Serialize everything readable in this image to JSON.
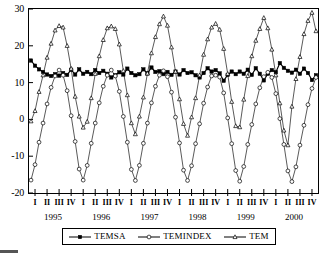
{
  "chart_data": {
    "type": "line",
    "title": "",
    "subtitle": "",
    "xlabel": "",
    "ylabel": "",
    "ylim": [
      -20,
      30
    ],
    "yticks": [
      30,
      20,
      10,
      0,
      -10,
      -20
    ],
    "grid": false,
    "legend_position": "bottom",
    "x_quarter_labels": [
      "I",
      "II",
      "III",
      "IV",
      "I",
      "II",
      "III",
      "IV",
      "I",
      "II",
      "III",
      "IV",
      "I",
      "II",
      "III",
      "IV",
      "I",
      "II",
      "III",
      "IV",
      "I",
      "II",
      "III",
      "IV"
    ],
    "x_year_labels": [
      "1995",
      "1996",
      "1997",
      "1998",
      "1999",
      "2000"
    ],
    "x_points_per_year": 12,
    "x_note": "monthly observations, Jan 1995 - Dec 2000",
    "series": [
      {
        "name": "TEMSA",
        "marker": "filled-square",
        "values": [
          16.0,
          14.6,
          13.6,
          12.9,
          12.2,
          11.8,
          12.3,
          11.9,
          12.6,
          12.1,
          13.5,
          12.2,
          13.6,
          12.4,
          12.9,
          12.3,
          13.4,
          12.6,
          13.2,
          12.4,
          11.4,
          12.0,
          12.8,
          12.2,
          13.8,
          12.6,
          12.0,
          12.3,
          13.6,
          12.5,
          14.1,
          12.9,
          13.1,
          12.3,
          12.9,
          12.1,
          13.0,
          12.2,
          13.4,
          12.6,
          12.8,
          12.0,
          11.4,
          12.6,
          13.9,
          13.0,
          13.4,
          12.5,
          10.5,
          12.1,
          13.0,
          12.3,
          13.0,
          12.4,
          13.5,
          12.1,
          13.9,
          12.4,
          10.6,
          12.4,
          13.4,
          12.8,
          15.3,
          14.0,
          13.2,
          12.7,
          13.5,
          12.4,
          13.8,
          12.6,
          10.7,
          12.0
        ]
      },
      {
        "name": "TEMINDEX",
        "marker": "open-circle",
        "values": [
          -16.5,
          -12.3,
          -6.2,
          -1.0,
          4.2,
          8.7,
          11.8,
          13.4,
          12.0,
          7.8,
          1.0,
          -6.0,
          -13.5,
          -16.5,
          -12.5,
          -6.5,
          -1.0,
          4.5,
          9.0,
          12.0,
          13.4,
          11.8,
          7.6,
          0.8,
          -6.2,
          -13.6,
          -16.6,
          -12.5,
          -6.5,
          -1.0,
          4.5,
          9.0,
          12.0,
          13.2,
          11.6,
          7.4,
          0.6,
          -6.4,
          -13.8,
          -16.6,
          -12.6,
          -6.6,
          -1.2,
          4.4,
          8.8,
          11.8,
          12.0,
          11.5,
          7.2,
          0.4,
          -6.6,
          -13.9,
          -16.8,
          -12.8,
          -6.8,
          -1.4,
          4.2,
          8.6,
          11.6,
          12.8,
          11.4,
          7.0,
          0.2,
          -6.8,
          -14.0,
          -16.9,
          -12.9,
          -7.0,
          -1.6,
          4.0,
          8.4,
          11.4
        ]
      },
      {
        "name": "TEM",
        "marker": "open-triangle",
        "values": [
          -0.5,
          2.3,
          7.5,
          12.0,
          16.8,
          20.6,
          24.2,
          25.4,
          25.0,
          20.0,
          13.8,
          6.2,
          0.8,
          -2.2,
          -0.6,
          5.8,
          12.4,
          17.2,
          21.6,
          24.8,
          25.3,
          24.6,
          20.4,
          13.2,
          6.6,
          -1.0,
          -4.0,
          0.8,
          6.0,
          12.5,
          18.0,
          22.4,
          25.9,
          28.0,
          25.5,
          19.6,
          13.0,
          5.5,
          -1.2,
          -4.4,
          0.6,
          5.8,
          12.0,
          17.6,
          21.8,
          25.0,
          26.0,
          24.4,
          19.2,
          12.4,
          4.8,
          -1.8,
          -2.1,
          5.4,
          11.8,
          17.2,
          21.4,
          24.6,
          27.6,
          24.8,
          19.0,
          12.0,
          4.4,
          -3.0,
          -7.0,
          3.5,
          11.0,
          17.0,
          23.2,
          26.8,
          29.0,
          24.0
        ]
      }
    ]
  },
  "legend": {
    "items": [
      {
        "label": "TEMSA",
        "marker": "filled-square"
      },
      {
        "label": "TEMINDEX",
        "marker": "open-circle"
      },
      {
        "label": "TEM",
        "marker": "open-triangle"
      }
    ]
  },
  "axes": {
    "y_tick_labels": [
      "30",
      "20",
      "10",
      "0",
      "-10",
      "-20"
    ]
  }
}
